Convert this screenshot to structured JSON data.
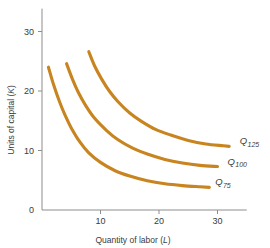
{
  "chart_data": {
    "type": "line",
    "title": "",
    "xlabel": "Quantity of labor (L)",
    "ylabel": "Units of capital (K)",
    "xlim": [
      0,
      35
    ],
    "ylim": [
      0,
      33
    ],
    "xticks": [
      10,
      20,
      30
    ],
    "xtick_labels": [
      "10",
      "20",
      "30"
    ],
    "yticks": [
      0,
      10,
      20,
      30
    ],
    "ytick_labels": [
      "0",
      "10",
      "20",
      "30"
    ],
    "grid": false,
    "legend_position": "inline-right-of-curve",
    "curve_color": "#c8841f",
    "axis_color": "#8d8d8d",
    "text_color": "#3b3b3b",
    "series": [
      {
        "name": "Q75",
        "label": "Q",
        "label_sub": "75",
        "label_x": 29.6,
        "label_y": 4.2,
        "points": [
          {
            "x": 1.1,
            "y": 24.0
          },
          {
            "x": 2.0,
            "y": 21.0
          },
          {
            "x": 3.0,
            "y": 18.2
          },
          {
            "x": 4.0,
            "y": 15.8
          },
          {
            "x": 5.0,
            "y": 13.8
          },
          {
            "x": 6.5,
            "y": 11.4
          },
          {
            "x": 8.0,
            "y": 9.6
          },
          {
            "x": 10.0,
            "y": 8.0
          },
          {
            "x": 12.5,
            "y": 6.6
          },
          {
            "x": 15.0,
            "y": 5.7
          },
          {
            "x": 18.0,
            "y": 4.9
          },
          {
            "x": 21.0,
            "y": 4.4
          },
          {
            "x": 24.0,
            "y": 4.1
          },
          {
            "x": 27.0,
            "y": 3.9
          },
          {
            "x": 28.6,
            "y": 3.8
          }
        ]
      },
      {
        "name": "Q100",
        "label": "Q",
        "label_sub": "100",
        "label_x": 31.7,
        "label_y": 7.6,
        "points": [
          {
            "x": 4.2,
            "y": 24.6
          },
          {
            "x": 5.2,
            "y": 22.0
          },
          {
            "x": 6.2,
            "y": 19.8
          },
          {
            "x": 7.5,
            "y": 17.5
          },
          {
            "x": 9.0,
            "y": 15.4
          },
          {
            "x": 11.0,
            "y": 13.4
          },
          {
            "x": 13.0,
            "y": 11.8
          },
          {
            "x": 15.5,
            "y": 10.4
          },
          {
            "x": 18.0,
            "y": 9.4
          },
          {
            "x": 21.0,
            "y": 8.5
          },
          {
            "x": 24.0,
            "y": 7.9
          },
          {
            "x": 27.0,
            "y": 7.5
          },
          {
            "x": 30.0,
            "y": 7.3
          }
        ]
      },
      {
        "name": "Q125",
        "label": "Q",
        "label_sub": "125",
        "label_x": 33.8,
        "label_y": 11.1,
        "points": [
          {
            "x": 8.0,
            "y": 26.6
          },
          {
            "x": 9.0,
            "y": 24.2
          },
          {
            "x": 10.2,
            "y": 22.0
          },
          {
            "x": 11.5,
            "y": 20.0
          },
          {
            "x": 13.0,
            "y": 18.2
          },
          {
            "x": 15.0,
            "y": 16.3
          },
          {
            "x": 17.0,
            "y": 14.9
          },
          {
            "x": 19.5,
            "y": 13.5
          },
          {
            "x": 22.0,
            "y": 12.6
          },
          {
            "x": 25.0,
            "y": 11.7
          },
          {
            "x": 28.0,
            "y": 11.1
          },
          {
            "x": 31.0,
            "y": 10.8
          },
          {
            "x": 32.0,
            "y": 10.7
          }
        ]
      }
    ]
  }
}
